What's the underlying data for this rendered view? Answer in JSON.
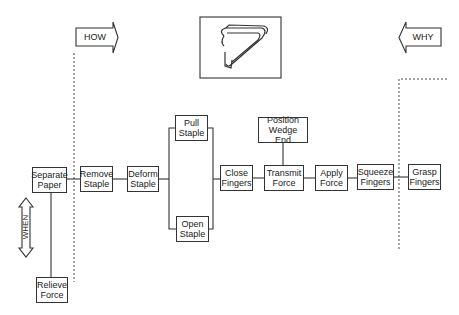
{
  "diagram": {
    "type": "FAST diagram (Function Analysis System Technique) for a staple remover",
    "directions": {
      "how": "HOW",
      "why": "WHY",
      "when": "WHEN"
    },
    "image": {
      "description": "staple remover illustration",
      "icon": "staple-remover-icon"
    },
    "functions": {
      "separate_paper": "Separate\nPaper",
      "remove_staple": "Remove\nStaple",
      "deform_staple": "Deform\nStaple",
      "pull_staple": "Pull\nStaple",
      "open_staple": "Open\nStaple",
      "close_fingers": "Close\nFingers",
      "position_wedge_end": "Position\nWedge End",
      "transmit_force": "Transmit\nForce",
      "apply_force": "Apply\nForce",
      "squeeze_fingers": "Squeeze\nFingers",
      "grasp_fingers": "Grasp\nFingers",
      "relieve_force": "Relieve\nForce"
    },
    "colors": {
      "line": "#333333",
      "background": "#ffffff"
    }
  }
}
